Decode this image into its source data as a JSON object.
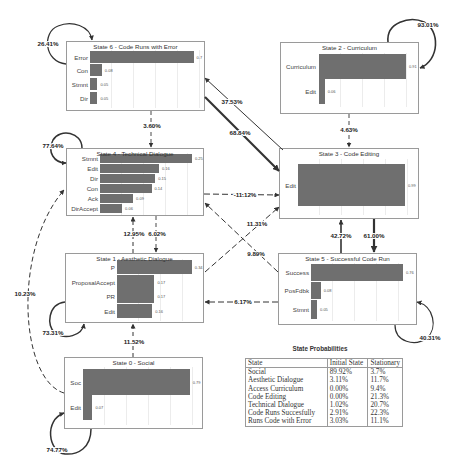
{
  "states": [
    {
      "id": "state-0",
      "title": "State 0 - Social",
      "bars": [
        {
          "label": "Soc",
          "value": 0.79,
          "value_label": "0.79"
        },
        {
          "label": "Edit",
          "value": 0.07,
          "value_label": "0.07"
        }
      ]
    },
    {
      "id": "state-1",
      "title": "State 1 - Aesthetic Dialogue",
      "bars": [
        {
          "label": "P",
          "value": 0.34,
          "value_label": "0.34"
        },
        {
          "label": "ProposalAccept",
          "value": 0.17,
          "value_label": "0.17"
        },
        {
          "label": "PR",
          "value": 0.17,
          "value_label": "0.17"
        },
        {
          "label": "Edit",
          "value": 0.16,
          "value_label": "0.16"
        }
      ]
    },
    {
      "id": "state-2",
      "title": "State 2 - Curriculum",
      "bars": [
        {
          "label": "Curriculum",
          "value": 0.91,
          "value_label": "0.91"
        },
        {
          "label": "Edit",
          "value": 0.06,
          "value_label": "0.06"
        }
      ]
    },
    {
      "id": "state-3",
      "title": "State 3 - Code Editing",
      "bars": [
        {
          "label": "Edit",
          "value": 0.99,
          "value_label": "0.99"
        }
      ]
    },
    {
      "id": "state-4",
      "title": "State 4 - Technical Dialogue",
      "bars": [
        {
          "label": "Stmnt",
          "value": 0.25,
          "value_label": "0.25"
        },
        {
          "label": "Edit",
          "value": 0.16,
          "value_label": "0.16"
        },
        {
          "label": "Dir",
          "value": 0.15,
          "value_label": "0.15"
        },
        {
          "label": "Con",
          "value": 0.14,
          "value_label": "0.14"
        },
        {
          "label": "Ack",
          "value": 0.09,
          "value_label": "0.09"
        },
        {
          "label": "DirAccept",
          "value": 0.06,
          "value_label": "0.06"
        }
      ]
    },
    {
      "id": "state-5",
      "title": "State 5 - Successful Code Run",
      "bars": [
        {
          "label": "Success",
          "value": 0.76,
          "value_label": "0.76"
        },
        {
          "label": "PosFdbk",
          "value": 0.08,
          "value_label": "0.08"
        },
        {
          "label": "Stmnt",
          "value": 0.05,
          "value_label": "0.05"
        }
      ]
    },
    {
      "id": "state-6",
      "title": "State 6 - Code Runs with Error",
      "bars": [
        {
          "label": "Error",
          "value": 0.7,
          "value_label": "0.7"
        },
        {
          "label": "Con",
          "value": 0.08,
          "value_label": "0.08"
        },
        {
          "label": "Stmnt",
          "value": 0.05,
          "value_label": "0.05"
        },
        {
          "label": "Dir",
          "value": 0.05,
          "value_label": "0.05"
        }
      ]
    }
  ],
  "transitions": [
    {
      "from": 6,
      "to": 6,
      "label": "26.41%"
    },
    {
      "from": 2,
      "to": 2,
      "label": "93.01%"
    },
    {
      "from": 4,
      "to": 4,
      "label": "77.64%"
    },
    {
      "from": 1,
      "to": 1,
      "label": "73.31%"
    },
    {
      "from": 0,
      "to": 0,
      "label": "74.77%"
    },
    {
      "from": 5,
      "to": 5,
      "label": "40.31%"
    },
    {
      "from": 6,
      "to": 4,
      "label": "3.60%"
    },
    {
      "from": 2,
      "to": 3,
      "label": "4.63%"
    },
    {
      "from": 3,
      "to": 6,
      "label": "37.53%"
    },
    {
      "from": 6,
      "to": 3,
      "label": "68.84%"
    },
    {
      "from": 4,
      "to": 3,
      "label": "-11.12%"
    },
    {
      "from": 1,
      "to": 3,
      "label": "11.31%"
    },
    {
      "from": 5,
      "to": 4,
      "label": "9.89%"
    },
    {
      "from": 1,
      "to": 4,
      "label": "12.95%"
    },
    {
      "from": 4,
      "to": 1,
      "label": "6.02%"
    },
    {
      "from": 5,
      "to": 3,
      "label": "42.72%"
    },
    {
      "from": 3,
      "to": 5,
      "label": "61.00%"
    },
    {
      "from": 5,
      "to": 1,
      "label": "6.17%"
    },
    {
      "from": 0,
      "to": 1,
      "label": "11.52%"
    },
    {
      "from": 0,
      "to": 4,
      "label": "10.23%"
    }
  ],
  "table": {
    "title": "State Probabilities",
    "headers": [
      "State",
      "Initial State",
      "Stationary"
    ],
    "rows": [
      [
        "Social",
        "89.92%",
        "3.7%"
      ],
      [
        "Aesthetic Dialogue",
        "3.11%",
        "11.7%"
      ],
      [
        "Access Curriculum",
        "0.00%",
        "9.4%"
      ],
      [
        "Code Editing",
        "0.00%",
        "21.3%"
      ],
      [
        "Technical Dialogue",
        "1.02%",
        "20.7%"
      ],
      [
        "Code Runs Succesfully",
        "2.91%",
        "22.3%"
      ],
      [
        "Runs Code with Error",
        "3.03%",
        "11.1%"
      ]
    ]
  },
  "colors": {
    "bar": "#6f6f6f",
    "border": "#9a9a9a",
    "edge": "#333333"
  }
}
